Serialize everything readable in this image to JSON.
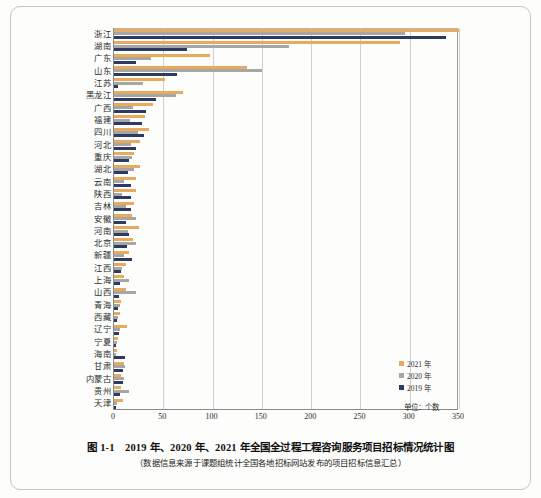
{
  "caption": {
    "figure_number": "图 1-1",
    "title": "2019 年、2020 年、2021 年全国全过程工程咨询服务项目招标情况统计图",
    "main": "图 1-1　2019 年、2020 年、2021 年全国全过程工程咨询服务项目招标情况统计图",
    "source_note": "（数据信息来源于课题组统计全国各地招标网站发布的项目招标信息汇总）"
  },
  "unit_label": "单位：个数",
  "colors": {
    "series_2021": "#e8ab5e",
    "series_2020": "#a6a6a6",
    "series_2019": "#2d3a63",
    "axis": "#8b8b8b",
    "grid": "#cfcfcf"
  },
  "chart_data": {
    "type": "bar",
    "orientation": "horizontal",
    "title": "2019 年、2020 年、2021 年全国全过程工程咨询服务项目招标情况统计图",
    "xlabel": "单位：个数",
    "ylabel": "",
    "xlim": [
      0,
      350
    ],
    "xticks": [
      0,
      50,
      100,
      150,
      200,
      250,
      300,
      350
    ],
    "xtick_labels": [
      "0",
      "50",
      "100",
      "150",
      "200",
      "250",
      "300",
      "350"
    ],
    "grid": true,
    "legend_position": "inside-bottom-right",
    "categories": [
      "浙江",
      "湖南",
      "广东",
      "山东",
      "江苏",
      "黑龙江",
      "广西",
      "福建",
      "四川",
      "河北",
      "重庆",
      "湖北",
      "云南",
      "陕西",
      "吉林",
      "安徽",
      "河南",
      "北京",
      "新疆",
      "江西",
      "上海",
      "山西",
      "青海",
      "西藏",
      "辽宁",
      "宁夏",
      "海南",
      "甘肃",
      "内蒙古",
      "贵州",
      "天津"
    ],
    "series": [
      {
        "name": "2021 年",
        "color": "#e8ab5e",
        "values": [
          350,
          290,
          97,
          135,
          52,
          70,
          40,
          31,
          36,
          26,
          20,
          26,
          22,
          22,
          20,
          18,
          25,
          19,
          15,
          12,
          10,
          12,
          7,
          6,
          13,
          4,
          3,
          10,
          7,
          7,
          9
        ]
      },
      {
        "name": "2020 年",
        "color": "#a6a6a6",
        "values": [
          295,
          178,
          38,
          150,
          29,
          63,
          19,
          16,
          24,
          17,
          18,
          20,
          10,
          8,
          12,
          22,
          14,
          22,
          10,
          8,
          15,
          22,
          6,
          4,
          6,
          3,
          2,
          11,
          10,
          15,
          3
        ]
      },
      {
        "name": "2019 年",
        "color": "#2d3a63",
        "values": [
          337,
          74,
          22,
          64,
          4,
          43,
          32,
          28,
          30,
          22,
          15,
          14,
          17,
          17,
          17,
          12,
          15,
          13,
          18,
          7,
          6,
          5,
          4,
          3,
          5,
          2,
          11,
          9,
          9,
          6,
          2
        ]
      }
    ]
  }
}
